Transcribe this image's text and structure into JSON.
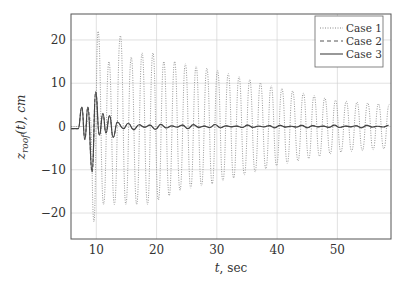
{
  "chart_data": {
    "type": "line",
    "title": "",
    "xlabel": "t, sec",
    "ylabel": "z_roof(t), cm",
    "xlim": [
      5.8,
      58.9
    ],
    "ylim": [
      -26,
      26
    ],
    "xticks": [
      10,
      20,
      30,
      40,
      50
    ],
    "yticks": [
      -20,
      -10,
      0,
      10,
      20
    ],
    "grid": true,
    "legend_position": "upper right",
    "series": [
      {
        "name": "Case 1",
        "style": "dotted",
        "color": "#888888",
        "description": "lightly damped oscillation, ~1.7 s period, amplitude ~21 cm near t=10-15 decaying to ~5 cm by t=58",
        "x": [
          5.8,
          8,
          9,
          9.6,
          10.3,
          11.2,
          12.1,
          13.0,
          14.0,
          14.9,
          15.8,
          16.7,
          17.6,
          18.5,
          19.4,
          20.3,
          21.2,
          22.1,
          23.0,
          30,
          40,
          50,
          58.9
        ],
        "values": [
          0,
          0,
          2,
          -22,
          22,
          -18,
          15,
          -18,
          21,
          -18,
          16,
          -18,
          17,
          -18,
          17,
          -17,
          15,
          -16,
          15,
          13,
          9,
          6,
          5
        ]
      },
      {
        "name": "Case 2",
        "style": "dashed",
        "color": "#555555",
        "x": [
          5.8,
          7,
          7.6,
          8.1,
          8.6,
          9.3,
          9.9,
          10.5,
          11.1,
          11.6,
          12.2,
          12.8,
          13.5,
          14.5,
          16,
          18,
          20,
          25,
          30,
          40,
          50,
          58.9
        ],
        "values": [
          -0.5,
          -0.5,
          4.5,
          -3,
          4.5,
          -10.5,
          8,
          -2,
          3,
          -1.5,
          2.5,
          -2.5,
          1,
          -0.5,
          0.8,
          -0.6,
          0.5,
          -0.5,
          0.2,
          0,
          0,
          0
        ]
      },
      {
        "name": "Case 3",
        "style": "solid",
        "color": "#444444",
        "x": [
          5.8,
          7,
          7.6,
          8.1,
          8.6,
          9.3,
          9.9,
          10.5,
          11.1,
          11.6,
          12.2,
          12.8,
          13.5,
          14.5,
          16,
          18,
          20,
          25,
          30,
          40,
          50,
          58.9
        ],
        "values": [
          -0.5,
          -0.5,
          4.5,
          -3,
          4.5,
          -10.5,
          8,
          -2,
          3,
          -1.5,
          2.5,
          -2.5,
          1,
          -0.5,
          0.8,
          -0.6,
          0.5,
          -0.5,
          0.2,
          0,
          0,
          0
        ]
      }
    ]
  },
  "axes": {
    "xlabel_var": "t",
    "xlabel_unit": ", sec",
    "ylabel_var": "z",
    "ylabel_sub": "roof",
    "ylabel_rest": "(t), cm"
  },
  "legend": {
    "items": [
      {
        "label": "Case 1",
        "style": "dotted"
      },
      {
        "label": "Case 2",
        "style": "dashed"
      },
      {
        "label": "Case 3",
        "style": "solid"
      }
    ]
  }
}
